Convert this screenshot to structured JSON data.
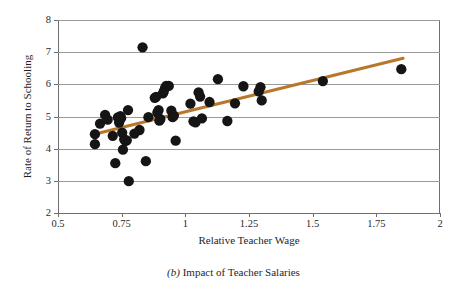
{
  "figure": {
    "caption_letter": "(b)",
    "caption_text": "Impact of Teacher Salaries"
  },
  "chart_data": {
    "type": "scatter",
    "title": "",
    "subtitle": "",
    "xlabel": "Relative Teacher Wage",
    "ylabel": "Rate of Return to Schooling",
    "xlim": [
      0.5,
      2
    ],
    "ylim": [
      2,
      8
    ],
    "xticks": [
      0.5,
      0.75,
      1,
      1.25,
      1.5,
      1.75,
      2
    ],
    "xtick_labels": [
      "0.5",
      "0.75",
      "1",
      "1.25",
      "1.5",
      "1.75",
      "2"
    ],
    "yticks": [
      2,
      3,
      4,
      5,
      6,
      7,
      8
    ],
    "ytick_labels": [
      "2",
      "3",
      "4",
      "5",
      "6",
      "7",
      "8"
    ],
    "grid": "horizontal",
    "legend": "none",
    "marker_color": "#151515",
    "marker_size": 5.2,
    "series": [
      {
        "name": "Countries",
        "type": "scatter",
        "points": [
          [
            0.645,
            4.45
          ],
          [
            0.645,
            4.14
          ],
          [
            0.665,
            4.78
          ],
          [
            0.685,
            5.05
          ],
          [
            0.695,
            4.9
          ],
          [
            0.715,
            4.4
          ],
          [
            0.725,
            3.55
          ],
          [
            0.735,
            4.97
          ],
          [
            0.74,
            4.81
          ],
          [
            0.745,
            5.01
          ],
          [
            0.748,
            4.95
          ],
          [
            0.752,
            4.5
          ],
          [
            0.755,
            3.97
          ],
          [
            0.76,
            4.29
          ],
          [
            0.765,
            4.24
          ],
          [
            0.77,
            4.26
          ],
          [
            0.775,
            5.2
          ],
          [
            0.778,
            2.99
          ],
          [
            0.8,
            4.47
          ],
          [
            0.82,
            4.58
          ],
          [
            0.832,
            7.15
          ],
          [
            0.845,
            3.61
          ],
          [
            0.855,
            4.98
          ],
          [
            0.88,
            5.58
          ],
          [
            0.885,
            5.61
          ],
          [
            0.89,
            5.12
          ],
          [
            0.895,
            5.2
          ],
          [
            0.898,
            4.87
          ],
          [
            0.902,
            4.92
          ],
          [
            0.912,
            5.72
          ],
          [
            0.915,
            5.77
          ],
          [
            0.92,
            5.88
          ],
          [
            0.925,
            5.95
          ],
          [
            0.935,
            5.95
          ],
          [
            0.945,
            5.18
          ],
          [
            0.95,
            4.98
          ],
          [
            0.955,
            5.03
          ],
          [
            0.962,
            4.25
          ],
          [
            1.02,
            5.4
          ],
          [
            1.032,
            4.85
          ],
          [
            1.04,
            4.82
          ],
          [
            1.052,
            5.75
          ],
          [
            1.058,
            5.62
          ],
          [
            1.065,
            4.94
          ],
          [
            1.095,
            5.45
          ],
          [
            1.128,
            6.16
          ],
          [
            1.165,
            4.86
          ],
          [
            1.195,
            5.41
          ],
          [
            1.228,
            5.94
          ],
          [
            1.288,
            5.78
          ],
          [
            1.295,
            5.91
          ],
          [
            1.3,
            5.5
          ],
          [
            1.54,
            6.1
          ],
          [
            1.848,
            6.47
          ]
        ]
      },
      {
        "name": "Fitted trend line",
        "type": "line",
        "color": "#b8782c",
        "points": [
          [
            0.638,
            4.44
          ],
          [
            1.855,
            6.81
          ]
        ]
      }
    ]
  }
}
